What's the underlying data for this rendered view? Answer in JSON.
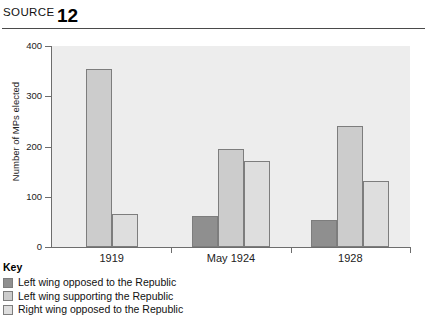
{
  "header": {
    "source_word": "SOURCE",
    "source_number": "12"
  },
  "legend": {
    "title": "Key",
    "items": [
      {
        "label": "Left wing opposed to the Republic",
        "color": "#8f8f8f"
      },
      {
        "label": "Left wing supporting the Republic",
        "color": "#cccccc"
      },
      {
        "label": "Right wing opposed to the Republic",
        "color": "#dedede"
      }
    ]
  },
  "chart_data": {
    "type": "bar",
    "title": "",
    "xlabel": "",
    "ylabel": "Number of MPs elected",
    "categories": [
      "1919",
      "May 1924",
      "1928"
    ],
    "ylim": [
      0,
      400
    ],
    "yticks": [
      0,
      100,
      200,
      300,
      400
    ],
    "ytick_labels": [
      "0",
      "100",
      "200",
      "300",
      "400"
    ],
    "grid": false,
    "legend_position": "below-left",
    "series": [
      {
        "name": "Left wing opposed to the Republic",
        "color": "#8f8f8f",
        "values": [
          0,
          62,
          53
        ]
      },
      {
        "name": "Left wing supporting the Republic",
        "color": "#cccccc",
        "values": [
          355,
          195,
          241
        ]
      },
      {
        "name": "Right wing opposed to the Republic",
        "color": "#dedede",
        "values": [
          65,
          172,
          131
        ]
      }
    ]
  }
}
